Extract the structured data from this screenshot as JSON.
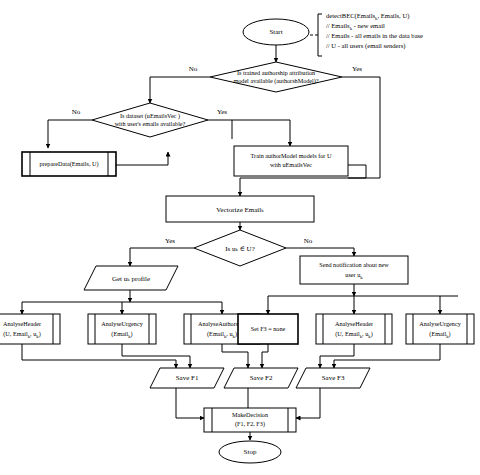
{
  "diagram": {
    "type": "flowchart",
    "nodes": {
      "start": {
        "label": "Start",
        "shape": "terminator"
      },
      "stop": {
        "label": "Stop",
        "shape": "terminator"
      },
      "decision_model": {
        "line1": "Is trained authorship attribution",
        "line2": "model available (authorshModel)?",
        "shape": "decision",
        "yes": "Yes",
        "no": "No"
      },
      "decision_dataset": {
        "line1": "Is dataset (uEmailsVec )",
        "line2": "with user's emails available?",
        "shape": "decision",
        "yes": "Yes",
        "no": "No"
      },
      "prepare_data": {
        "label": "prepareData(Emails, U)",
        "shape": "predefined-process"
      },
      "train_model": {
        "line1": "Train authorModel models for U",
        "line2": "with uEmailsVec",
        "shape": "process"
      },
      "vectorize": {
        "label": "Vectorize Email",
        "sub": "k",
        "shape": "process"
      },
      "decision_user": {
        "label_pre": "Is u",
        "label_sub": "k",
        "label_post": " ∈ U?",
        "shape": "decision",
        "yes": "Yes",
        "no": "No"
      },
      "get_profile": {
        "label_pre": "Get u",
        "label_sub": "k",
        "label_post": " profile",
        "shape": "data"
      },
      "send_notification": {
        "line1": "Send notification about new",
        "line2_pre": "user u",
        "line2_sub": "k",
        "shape": "process"
      },
      "analyse_header_left": {
        "line1": "AnalyseHeader",
        "line2_pre": "(U, Email",
        "line2_sub1": "k",
        "line2_mid": ", u",
        "line2_sub2": "k",
        "line2_post": ")",
        "shape": "predefined-process"
      },
      "analyse_urgency_left": {
        "line1": "AnalyseUrgency",
        "line2_pre": "(Email",
        "line2_sub": "k",
        "line2_post": ")",
        "shape": "predefined-process"
      },
      "analyse_authorship": {
        "line1": "AnalyseAuthorship",
        "line2_pre": "(Email",
        "line2_sub1": "k",
        "line2_mid": ", u",
        "line2_sub2": "k",
        "line2_post": ")",
        "shape": "predefined-process"
      },
      "set_f3": {
        "label": "Set F3 = none",
        "shape": "process-thick"
      },
      "analyse_header_right": {
        "line1": "AnalyseHeader",
        "line2_pre": "(U, Email",
        "line2_sub1": "k",
        "line2_mid": ", u",
        "line2_sub2": "k",
        "line2_post": ")",
        "shape": "predefined-process"
      },
      "analyse_urgency_right": {
        "line1": "AnalyseUrgency",
        "line2_pre": "(Email",
        "line2_sub": "k",
        "line2_post": ")",
        "shape": "predefined-process"
      },
      "save_f1": {
        "label": "Save F1",
        "shape": "data"
      },
      "save_f2": {
        "label": "Save F2",
        "shape": "data"
      },
      "save_f3": {
        "label": "Save F3",
        "shape": "data"
      },
      "make_decision": {
        "line1": "MakeDecision",
        "line2": "(F1, F2, F3)",
        "shape": "predefined-process"
      }
    },
    "annotation": {
      "line1_pre": "detectBEC(Emails",
      "line1_sub": "k",
      "line1_post": ", Emails, U)",
      "line2_pre": "// Emails",
      "line2_sub": "k",
      "line2_post": " - new email",
      "line3": "// Emails - all emails in the data base",
      "line4": "// U - all users (email senders)"
    },
    "colors": {
      "stroke": "#000000",
      "fill": "#ffffff",
      "background": "#ffffff"
    }
  }
}
